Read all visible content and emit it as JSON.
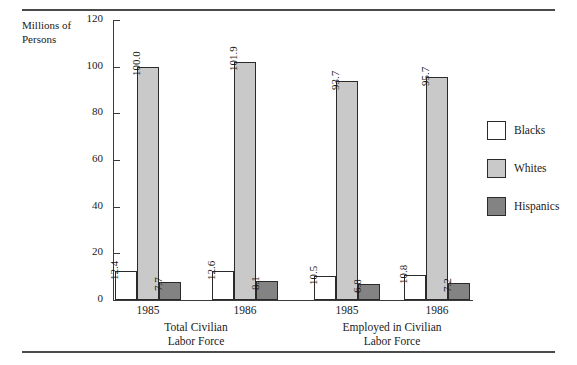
{
  "axis": {
    "y_title": "Millions of\nPersons"
  },
  "legend": {
    "items": [
      {
        "label": "Blacks",
        "key": "blacks",
        "color": "#ffffff"
      },
      {
        "label": "Whites",
        "key": "whites",
        "color": "#c9c9c9"
      },
      {
        "label": "Hispanics",
        "key": "hispanics",
        "color": "#838383"
      }
    ]
  },
  "chart_data": {
    "type": "bar",
    "title": "",
    "xlabel": "",
    "ylabel": "Millions of Persons",
    "ylim": [
      0,
      120
    ],
    "yticks": [
      0,
      20,
      40,
      60,
      80,
      100,
      120
    ],
    "ytick_labels": [
      "0",
      "20",
      "40",
      "60",
      "80",
      "100",
      "120"
    ],
    "grid": false,
    "legend_position": "right",
    "categories": [
      "1985",
      "1986",
      "1985",
      "1986"
    ],
    "groups": [
      {
        "caption": "Total Civilian\nLabor Force",
        "clusters": [
          {
            "year": "1985",
            "bars": [
              {
                "series": "Blacks",
                "value": 12.4,
                "label": "12.4"
              },
              {
                "series": "Whites",
                "value": 100.0,
                "label": "100.0"
              },
              {
                "series": "Hispanics",
                "value": 7.7,
                "label": "7.7"
              }
            ]
          },
          {
            "year": "1986",
            "bars": [
              {
                "series": "Blacks",
                "value": 12.6,
                "label": "12.6"
              },
              {
                "series": "Whites",
                "value": 101.9,
                "label": "101.9"
              },
              {
                "series": "Hispanics",
                "value": 8.1,
                "label": "8.1"
              }
            ]
          }
        ]
      },
      {
        "caption": "Employed in Civilian\nLabor Force",
        "clusters": [
          {
            "year": "1985",
            "bars": [
              {
                "series": "Blacks",
                "value": 10.5,
                "label": "10.5"
              },
              {
                "series": "Whites",
                "value": 93.7,
                "label": "93.7"
              },
              {
                "series": "Hispanics",
                "value": 6.8,
                "label": "6.8"
              }
            ]
          },
          {
            "year": "1986",
            "bars": [
              {
                "series": "Blacks",
                "value": 10.8,
                "label": "10.8"
              },
              {
                "series": "Whites",
                "value": 95.7,
                "label": "95.7"
              },
              {
                "series": "Hispanics",
                "value": 7.2,
                "label": "7.2"
              }
            ]
          }
        ]
      }
    ],
    "series": [
      {
        "name": "Blacks",
        "values": [
          12.4,
          12.6,
          10.5,
          10.8
        ]
      },
      {
        "name": "Whites",
        "values": [
          100.0,
          101.9,
          93.7,
          95.7
        ]
      },
      {
        "name": "Hispanics",
        "values": [
          7.7,
          8.1,
          6.8,
          7.2
        ]
      }
    ]
  },
  "layout": {
    "cluster_centers": [
      148,
      245,
      347,
      437
    ],
    "group_caption_centers": [
      196,
      392
    ],
    "bar_width": 22,
    "bar_gap": 0
  }
}
